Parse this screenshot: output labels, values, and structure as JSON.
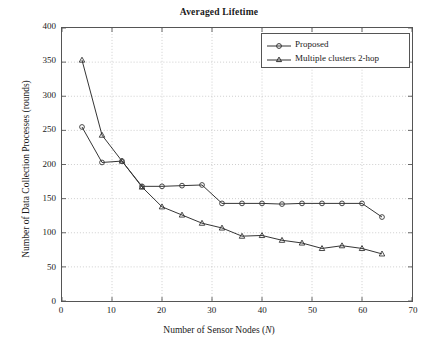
{
  "figure": {
    "title": "Averaged Lifetime",
    "background": "#ffffff",
    "axis_color": "#555555",
    "grid_color": "#b9b9b9",
    "text_color": "#1a1a1a"
  },
  "legend": {
    "position": "top-right-inside",
    "entries": [
      {
        "label": "Proposed",
        "marker": "circle",
        "color": "#333333"
      },
      {
        "label": "Multiple clusters 2-hop",
        "marker": "triangle",
        "color": "#333333"
      }
    ]
  },
  "chart_data": {
    "type": "line",
    "title": "Averaged Lifetime",
    "xlabel": "Number of Sensor Nodes (N)",
    "ylabel": "Number of Data Collection Processes (rounds)",
    "xlim": [
      0,
      70
    ],
    "ylim": [
      0,
      400
    ],
    "xticks": [
      0,
      10,
      20,
      30,
      40,
      50,
      60,
      70
    ],
    "yticks": [
      0,
      50,
      100,
      150,
      200,
      250,
      300,
      350,
      400
    ],
    "grid": true,
    "grid_style": "dotted",
    "legend_position": "upper right",
    "x": [
      4,
      8,
      12,
      16,
      20,
      24,
      28,
      32,
      36,
      40,
      44,
      48,
      52,
      56,
      60,
      64
    ],
    "series": [
      {
        "name": "Proposed",
        "marker": "circle",
        "color": "#333333",
        "values": [
          255,
          203,
          205,
          168,
          168,
          169,
          170,
          143,
          143,
          143,
          142,
          143,
          143,
          143,
          143,
          123
        ]
      },
      {
        "name": "Multiple clusters 2-hop",
        "marker": "triangle",
        "color": "#333333",
        "values": [
          353,
          243,
          205,
          167,
          138,
          126,
          114,
          107,
          95,
          96,
          89,
          85,
          77,
          81,
          77,
          69
        ]
      }
    ]
  }
}
